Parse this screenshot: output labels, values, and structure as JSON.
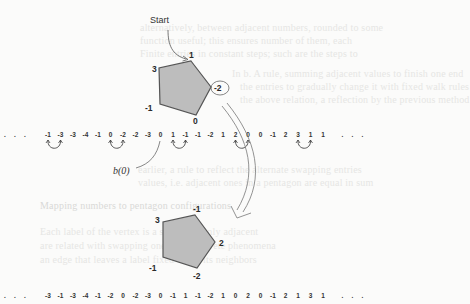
{
  "figure": {
    "start_label": "Start",
    "bzero_label": "b(0)",
    "top_pentagon": {
      "vertex_labels": [
        "1",
        "-2",
        "0",
        "-1",
        "3"
      ],
      "highlighted_vertex": "-2"
    },
    "bottom_pentagon": {
      "vertex_labels": [
        "-1",
        "2",
        "-2",
        "-1",
        "3"
      ]
    },
    "top_sequence": {
      "leading": ". . .",
      "values": [
        "-1",
        "-3",
        "-3",
        "-4",
        "-1",
        "0",
        "-2",
        "-2",
        "-3",
        "0",
        "1",
        "-1",
        "-1",
        "-2",
        "1",
        "2",
        "0",
        "0",
        "-1",
        "2",
        "3",
        "1",
        "1"
      ],
      "trailing": ". . .",
      "swap_pairs": [
        [
          0,
          1
        ],
        [
          5,
          6
        ],
        [
          10,
          11
        ],
        [
          15,
          16
        ],
        [
          20,
          21
        ]
      ],
      "bzero_index": 9
    },
    "bottom_sequence": {
      "leading": ". . .",
      "values": [
        "-3",
        "-1",
        "-3",
        "-4",
        "-1",
        "-2",
        "0",
        "-2",
        "-3",
        "0",
        "-1",
        "1",
        "-1",
        "-2",
        "1",
        "0",
        "2",
        "0",
        "-1",
        "2",
        "1",
        "3",
        "1"
      ],
      "trailing": ". . ."
    },
    "colors": {
      "pentagon_fill": "#bdbdbd",
      "pentagon_stroke": "#555555",
      "ink": "#333333"
    }
  },
  "background_text": [
    "alternatively, between adjacent numbers, rounded to some",
    "function useful; this ensures number of them, each",
    "Finite entries in constant steps; such are the steps to",
    "In b. A rule, summing adjacent values to finish one end",
    "the entries to gradually change it with fixed walk rules",
    "the above relation, a reflection by the previous method",
    "earlier, a rule to reflect the alternate swapping entries",
    "values, i.e. adjacent ones in a pentagon are equal in sum",
    "Mapping numbers to pentagon configurations",
    "Each label of the vertex is a step sum; only adjacent",
    "are related with swapping one pair; Discrete phenomena",
    "an edge that leaves a label fixed while its neighbors"
  ]
}
